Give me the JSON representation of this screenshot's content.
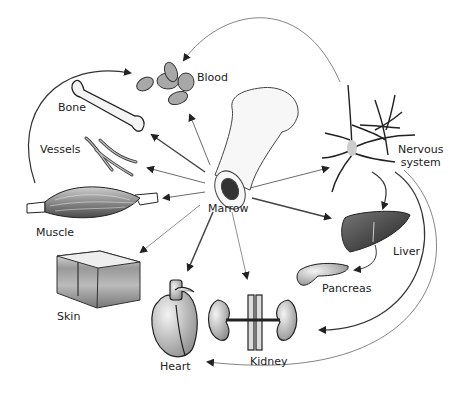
{
  "diagram": {
    "center": {
      "label": "Marrow"
    },
    "nodes": [
      {
        "id": "blood",
        "label": "Blood"
      },
      {
        "id": "bone",
        "label": "Bone"
      },
      {
        "id": "vessels",
        "label": "Vessels"
      },
      {
        "id": "muscle",
        "label": "Muscle"
      },
      {
        "id": "skin",
        "label": "Skin"
      },
      {
        "id": "heart",
        "label": "Heart"
      },
      {
        "id": "kidney",
        "label": "Kidney"
      },
      {
        "id": "pancreas",
        "label": "Pancreas"
      },
      {
        "id": "liver",
        "label": "Liver"
      },
      {
        "id": "nervous",
        "label_line1": "Nervous",
        "label_line2": "system"
      }
    ],
    "edges": [
      {
        "from": "marrow",
        "to": "blood"
      },
      {
        "from": "marrow",
        "to": "bone"
      },
      {
        "from": "marrow",
        "to": "vessels"
      },
      {
        "from": "marrow",
        "to": "muscle"
      },
      {
        "from": "marrow",
        "to": "skin"
      },
      {
        "from": "marrow",
        "to": "heart"
      },
      {
        "from": "marrow",
        "to": "kidney"
      },
      {
        "from": "marrow",
        "to": "liver"
      },
      {
        "from": "marrow",
        "to": "nervous"
      },
      {
        "from": "muscle",
        "to": "blood"
      },
      {
        "from": "nervous",
        "to": "blood"
      },
      {
        "from": "nervous",
        "to": "liver"
      },
      {
        "from": "liver",
        "to": "pancreas"
      },
      {
        "from": "nervous",
        "to": "kidney"
      },
      {
        "from": "nervous",
        "to": "heart"
      }
    ]
  }
}
